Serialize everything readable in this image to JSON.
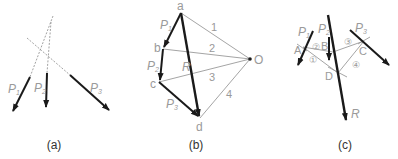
{
  "colors": {
    "force": "#1a1a1a",
    "thin": "#9a9a9a",
    "label": "#9a9a9a",
    "caption": "#333333"
  },
  "panels": [
    {
      "id": "a",
      "caption": "(a)",
      "forces": [
        {
          "label": "P",
          "sub": "1"
        },
        {
          "label": "P",
          "sub": "2"
        },
        {
          "label": "P",
          "sub": "3"
        }
      ]
    },
    {
      "id": "b",
      "caption": "(b)",
      "points": [
        "a",
        "b",
        "c",
        "d",
        "O"
      ],
      "forces": [
        {
          "label": "P",
          "sub": "1"
        },
        {
          "label": "P",
          "sub": "2"
        },
        {
          "label": "P",
          "sub": "3"
        },
        {
          "label": "R",
          "sub": ""
        }
      ],
      "rays": [
        "1",
        "2",
        "3",
        "4"
      ]
    },
    {
      "id": "c",
      "caption": "(c)",
      "points": [
        "A",
        "B",
        "C",
        "D"
      ],
      "forces": [
        {
          "label": "P",
          "sub": "1"
        },
        {
          "label": "P",
          "sub": "2"
        },
        {
          "label": "P",
          "sub": "3"
        },
        {
          "label": "R",
          "sub": ""
        }
      ],
      "segments": [
        "①",
        "②",
        "③",
        "④"
      ]
    }
  ]
}
